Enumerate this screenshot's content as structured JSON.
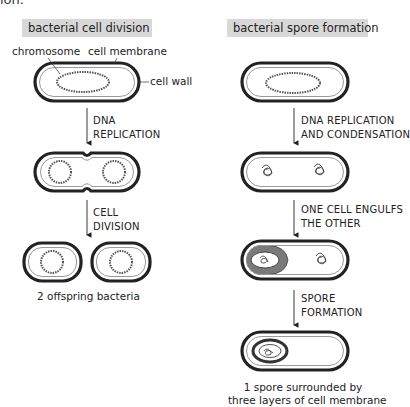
{
  "top_cut_text": "ion.",
  "left_panel": {
    "title": "bacterial cell division",
    "labels": {
      "chromosome": "chromosome",
      "cell_membrane": "cell membrane",
      "cell_wall": "cell wall"
    },
    "steps": [
      {
        "line1": "DNA",
        "line2": "REPLICATION"
      },
      {
        "line1": "CELL",
        "line2": "DIVISION"
      }
    ],
    "caption": "2 offspring bacteria"
  },
  "right_panel": {
    "title": "bacterial spore formation",
    "steps": [
      {
        "line1": "DNA REPLICATION",
        "line2": "AND CONDENSATION"
      },
      {
        "line1": "ONE CELL ENGULFS",
        "line2": "THE OTHER"
      },
      {
        "line1": "SPORE",
        "line2": "FORMATION"
      }
    ],
    "caption": {
      "line1": "1 spore surrounded by",
      "line2": "three layers of cell membrane"
    }
  },
  "colors": {
    "title_box": "#d8d8d8",
    "cell_wall": "#222222",
    "membrane_gap": "#9a9a9a",
    "engulf_fill": "#7a7a7a"
  }
}
